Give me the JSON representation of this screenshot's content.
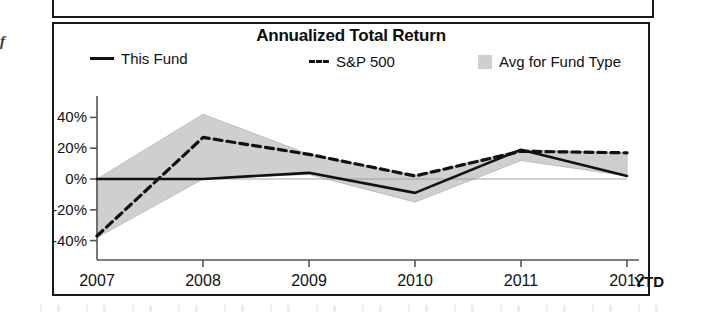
{
  "panel_above": {
    "present": true
  },
  "margin_fragment": {
    "text": "f"
  },
  "chart": {
    "title": "Annualized Total Return",
    "legend": [
      {
        "label": "This Fund",
        "marker": "solid-line-swatch"
      },
      {
        "label": "S&P 500",
        "marker": "dashed-line-swatch"
      },
      {
        "label": "Avg for Fund Type",
        "marker": "gray-area-swatch"
      }
    ],
    "x_suffix_label": "YTD",
    "colors": {
      "line": "#111111",
      "area_fill": "#cfcfcf",
      "axis": "#555555",
      "frame": "#1a1a1a",
      "text": "#111111"
    }
  },
  "chart_data": {
    "type": "line",
    "title": "Annualized Total Return",
    "xlabel": "",
    "ylabel": "",
    "x": [
      "2007",
      "2008",
      "2009",
      "2010",
      "2011",
      "2012"
    ],
    "categories": [
      "2007",
      "2008",
      "2009",
      "2010",
      "2011",
      "2012"
    ],
    "x_note": "2012 value is year-to-date (YTD)",
    "ylim": [
      -50,
      50
    ],
    "yticks": [
      40,
      20,
      0,
      -20,
      -40
    ],
    "ytick_labels": [
      "40%",
      "20%",
      "0%",
      "-20%",
      "-40%"
    ],
    "y_unit": "percent",
    "grid": false,
    "legend_position": "top",
    "series": [
      {
        "name": "This Fund",
        "style": "solid",
        "color": "#111111",
        "values": [
          0,
          0,
          4,
          -9,
          19,
          2
        ]
      },
      {
        "name": "S&P 500",
        "style": "dashed",
        "color": "#111111",
        "values": [
          -37,
          27,
          16,
          2,
          18,
          17
        ]
      },
      {
        "name": "Avg for Fund Type",
        "style": "area-band",
        "color": "#cfcfcf",
        "upper": [
          0,
          42,
          16,
          2,
          19,
          17
        ],
        "lower": [
          -38,
          0,
          3,
          -15,
          12,
          2
        ]
      }
    ]
  }
}
